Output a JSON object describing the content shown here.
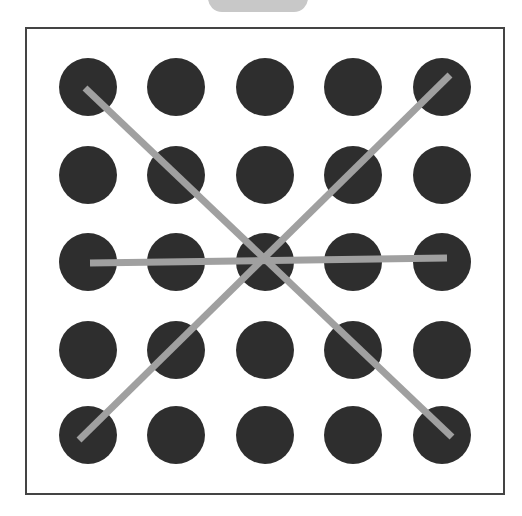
{
  "puzzle": {
    "type": "dot-grid-pattern",
    "grid": {
      "rows": 5,
      "cols": 5
    },
    "dot_color": "#2e2e2e",
    "line_color": "#a0a0a0",
    "frame_color": "#444444",
    "tab_color": "#c8c8c8",
    "dot_radius": 29,
    "line_width": 7,
    "col_x": [
      88,
      176,
      265,
      353,
      442
    ],
    "row_y": [
      87,
      175,
      262,
      350,
      435
    ],
    "lines": [
      {
        "name": "diagonal-top-left-to-bottom-right",
        "from": [
          0,
          0
        ],
        "to": [
          4,
          4
        ],
        "x1": 85,
        "y1": 88,
        "x2": 452,
        "y2": 437
      },
      {
        "name": "diagonal-top-right-to-bottom-left",
        "from": [
          0,
          4
        ],
        "to": [
          4,
          0
        ],
        "x1": 450,
        "y1": 75,
        "x2": 79,
        "y2": 440
      },
      {
        "name": "horizontal-middle-row",
        "from": [
          2,
          0
        ],
        "to": [
          2,
          4
        ],
        "x1": 90,
        "y1": 263,
        "x2": 447,
        "y2": 258
      }
    ]
  }
}
